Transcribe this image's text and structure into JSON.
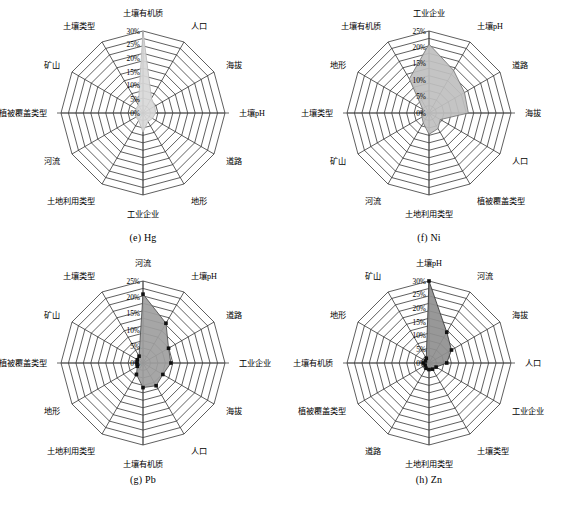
{
  "figure": {
    "panel_count": 4,
    "background_color": "#ffffff",
    "line_color": "#1a1a1a"
  },
  "chart_data": [
    {
      "type": "radar",
      "title": "(e) Hg",
      "panel_id": "e",
      "element": "Hg",
      "categories": [
        "土壤有机质",
        "人口",
        "海拔",
        "土壤pH",
        "道路",
        "地形",
        "工业企业",
        "土地利用类型",
        "河流",
        "植被覆盖类型",
        "矿山",
        "土壤类型"
      ],
      "values": [
        30.0,
        6.2,
        5.0,
        4.6,
        4.0,
        3.6,
        7.0,
        3.2,
        3.0,
        2.8,
        3.0,
        3.4
      ],
      "tick_labels": [
        "0%",
        "5%",
        "10%",
        "15%",
        "20%",
        "25%",
        "30%"
      ],
      "tick_values": [
        0,
        5,
        10,
        15,
        20,
        25,
        30
      ],
      "rmax": 30,
      "rings": 11,
      "fill_color": "#d8d8d8",
      "stroke_color": "#bdbdbd",
      "marker_shown": false,
      "ylabel": "",
      "xlabel": "",
      "grid": true,
      "legend": "none"
    },
    {
      "type": "radar",
      "title": "(f) Ni",
      "panel_id": "f",
      "element": "Ni",
      "categories": [
        "工业企业",
        "土壤pH",
        "道路",
        "海拔",
        "人口",
        "植被覆盖类型",
        "土地利用类型",
        "河流",
        "矿山",
        "土壤类型",
        "地形",
        "土壤有机质"
      ],
      "values": [
        21.0,
        15.0,
        12.5,
        12.0,
        4.0,
        5.5,
        6.5,
        3.5,
        2.5,
        2.0,
        2.2,
        12.0
      ],
      "tick_labels": [
        "0%",
        "5%",
        "10%",
        "15%",
        "20%",
        "25%"
      ],
      "tick_values": [
        0,
        5,
        10,
        15,
        20,
        25
      ],
      "rmax": 25,
      "rings": 11,
      "fill_color": "#bfbfbf",
      "stroke_color": "#7a7a7a",
      "marker_shown": false,
      "ylabel": "",
      "xlabel": "",
      "grid": true,
      "legend": "none"
    },
    {
      "type": "radar",
      "title": "(g) Pb",
      "panel_id": "g",
      "element": "Pb",
      "categories": [
        "河流",
        "土壤pH",
        "道路",
        "工业企业",
        "海拔",
        "人口",
        "土壤有机质",
        "土地利用类型",
        "地形",
        "植被覆盖类型",
        "矿山",
        "土壤类型"
      ],
      "values": [
        21.0,
        14.0,
        9.0,
        8.5,
        7.0,
        8.0,
        7.5,
        4.0,
        2.0,
        1.8,
        2.0,
        2.4
      ],
      "tick_labels": [
        "0%",
        "5%",
        "10%",
        "15%",
        "20%",
        "25%"
      ],
      "tick_values": [
        0,
        5,
        10,
        15,
        20,
        25
      ],
      "rmax": 25,
      "rings": 11,
      "fill_color": "#9e9e9e",
      "stroke_color": "#555555",
      "marker_shown": true,
      "ylabel": "",
      "xlabel": "",
      "grid": true,
      "legend": "none"
    },
    {
      "type": "radar",
      "title": "(h) Zn",
      "panel_id": "h",
      "element": "Zn",
      "categories": [
        "土壤pH",
        "河流",
        "海拔",
        "人口",
        "工业企业",
        "土壤类型",
        "土地利用类型",
        "道路",
        "植被覆盖类型",
        "土壤有机质",
        "地形",
        "矿山"
      ],
      "values": [
        30.0,
        13.0,
        9.5,
        6.5,
        3.0,
        2.6,
        2.4,
        2.2,
        1.6,
        2.0,
        1.5,
        2.0
      ],
      "tick_labels": [
        "0%",
        "5%",
        "10%",
        "15%",
        "20%",
        "25%",
        "30%"
      ],
      "tick_values": [
        0,
        5,
        10,
        15,
        20,
        25,
        30
      ],
      "rmax": 30,
      "rings": 11,
      "fill_color": "#8f8f8f",
      "stroke_color": "#3d3d3d",
      "marker_shown": true,
      "ylabel": "",
      "xlabel": "",
      "grid": true,
      "legend": "none"
    }
  ]
}
